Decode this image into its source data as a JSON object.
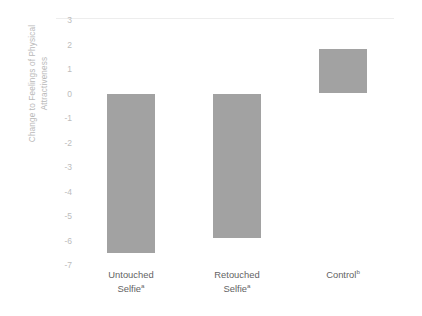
{
  "chart_data": {
    "type": "bar",
    "title": "",
    "subtitle": "",
    "xlabel": "",
    "ylabel": "Change to Feelings of Physical Attractiveness",
    "ylabel_lines": [
      "Change to Feelings of Physical",
      "Attractiveness"
    ],
    "categories": [
      "Untouched Selfie",
      "Retouched Selfie",
      "Control"
    ],
    "category_lines": [
      [
        "Untouched",
        "Selfie"
      ],
      [
        "Retouched",
        "Selfie"
      ],
      [
        "Control",
        ""
      ]
    ],
    "category_superscripts": [
      "a",
      "a",
      "b"
    ],
    "values": [
      -6.5,
      -5.9,
      1.8
    ],
    "ylim": [
      -7,
      3
    ],
    "yticks": [
      3,
      2,
      1,
      0,
      -1,
      -2,
      -3,
      -4,
      -5,
      -6,
      -7
    ],
    "ytick_labels": [
      "3",
      "2",
      "1",
      "0",
      "-1",
      "-2",
      "-3",
      "-4",
      "-5",
      "-6",
      "-7"
    ],
    "grid": false,
    "legend": "none",
    "bar_color": "#a2a2a2",
    "axis_text_color": "#bcbcbc",
    "category_text_color": "#636363",
    "background_color": "#ffffff"
  }
}
